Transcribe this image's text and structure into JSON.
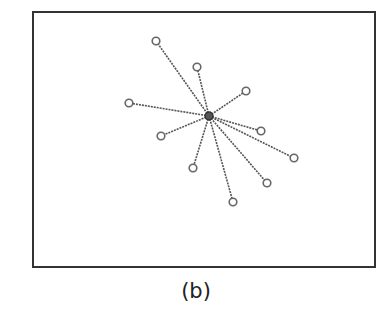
{
  "caption": "(b)",
  "frame": {
    "x": 33,
    "y": 12,
    "width": 342,
    "height": 255,
    "stroke": "#333333"
  },
  "graph": {
    "type": "star",
    "center": {
      "x": 209,
      "y": 116
    },
    "edge_color": "#555555",
    "node_color": "#666666",
    "leaves": [
      {
        "x": 156,
        "y": 41
      },
      {
        "x": 197,
        "y": 67
      },
      {
        "x": 246,
        "y": 91
      },
      {
        "x": 129,
        "y": 103
      },
      {
        "x": 161,
        "y": 136
      },
      {
        "x": 261,
        "y": 131
      },
      {
        "x": 294,
        "y": 158
      },
      {
        "x": 193,
        "y": 168
      },
      {
        "x": 267,
        "y": 183
      },
      {
        "x": 233,
        "y": 202
      }
    ]
  }
}
